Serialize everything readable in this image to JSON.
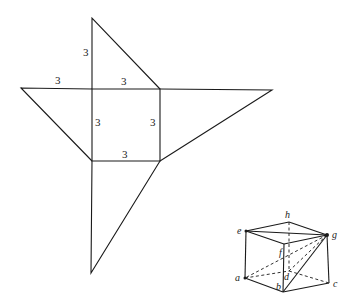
{
  "net": {
    "square": {
      "tl": [
        92,
        89
      ],
      "tr": [
        160,
        89
      ],
      "br": [
        160,
        161
      ],
      "bl": [
        92,
        161
      ]
    },
    "outer_vertices": {
      "top": [
        92,
        18
      ],
      "left": [
        21,
        88
      ],
      "right": [
        272,
        90
      ],
      "bottom": [
        91,
        273
      ]
    },
    "labels": [
      {
        "id": "top-left-edge",
        "text": "3",
        "x": 83,
        "y": 56
      },
      {
        "id": "left-top-edge",
        "text": "3",
        "x": 55,
        "y": 84
      },
      {
        "id": "square-top",
        "text": "3",
        "x": 121,
        "y": 85
      },
      {
        "id": "square-left",
        "text": "3",
        "x": 95,
        "y": 126
      },
      {
        "id": "square-right",
        "text": "3",
        "x": 150,
        "y": 126
      },
      {
        "id": "square-bottom",
        "text": "3",
        "x": 122,
        "y": 158
      }
    ]
  },
  "cube": {
    "vertices": {
      "e": [
        246,
        231
      ],
      "h": [
        289,
        222
      ],
      "g": [
        327,
        235
      ],
      "f": [
        284,
        244
      ],
      "a": [
        245,
        278
      ],
      "d": [
        289,
        271
      ],
      "c": [
        329,
        283
      ],
      "b": [
        283,
        292
      ]
    },
    "labels": [
      {
        "id": "e",
        "text": "e",
        "x": 237,
        "y": 234
      },
      {
        "id": "h",
        "text": "h",
        "x": 285,
        "y": 218
      },
      {
        "id": "g",
        "text": "g",
        "x": 332,
        "y": 238
      },
      {
        "id": "f",
        "text": "f",
        "x": 279,
        "y": 256
      },
      {
        "id": "a",
        "text": "a",
        "x": 235,
        "y": 281
      },
      {
        "id": "d",
        "text": "d",
        "x": 284,
        "y": 280
      },
      {
        "id": "b",
        "text": "b",
        "x": 276,
        "y": 290
      },
      {
        "id": "c",
        "text": "c",
        "x": 333,
        "y": 287
      }
    ]
  }
}
